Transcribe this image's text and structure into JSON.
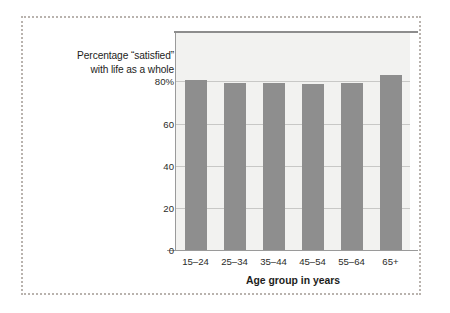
{
  "figure": {
    "frame_style": "dotted",
    "frame_color": "#b9b3ae",
    "background": "#ffffff"
  },
  "caption": {
    "line1": "Percentage “satisfied”",
    "line2": "with life as a whole"
  },
  "chart_data": {
    "type": "bar",
    "title": "",
    "subtitle": "",
    "categories": [
      "15–24",
      "25–34",
      "35–44",
      "45–54",
      "55–64",
      "65+"
    ],
    "values": [
      80.9,
      79.5,
      79.5,
      79.0,
      79.5,
      82.9
    ],
    "series": [
      {
        "name": "Percentage “satisfied” with life as a whole",
        "values": [
          80.9,
          79.5,
          79.5,
          79.0,
          79.5,
          82.9
        ]
      }
    ],
    "xlabel": "Age group in years",
    "ylabel": "Percentage “satisfied” with life as a whole",
    "ylim": [
      0,
      103
    ],
    "yticks": [
      0,
      20,
      40,
      60,
      80
    ],
    "ytick_labels": [
      "0",
      "20",
      "40",
      "60",
      "80%"
    ],
    "grid": true,
    "grid_axis": "y",
    "legend": false,
    "legend_position": "none",
    "bar_color": "#8e8e8e",
    "plot_background": "#f2f2f0",
    "gridline_color": "#c8c8c6"
  }
}
